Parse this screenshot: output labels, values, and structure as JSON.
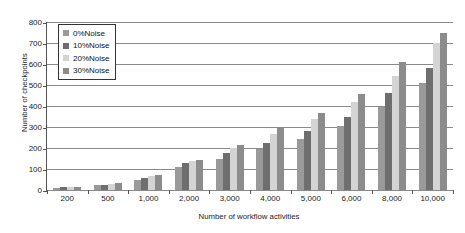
{
  "chart_data": {
    "type": "bar",
    "title": "",
    "xlabel": "Number of workflow activities",
    "ylabel": "Number of checkpoints",
    "ylim": [
      0,
      800
    ],
    "yticks": [
      0,
      100,
      200,
      300,
      400,
      500,
      600,
      700,
      800
    ],
    "ytick_labels": [
      "0",
      "100",
      "200",
      "300",
      "400",
      "500",
      "600",
      "700",
      "800"
    ],
    "grid": true,
    "legend_position": "upper-left",
    "categories": [
      "200",
      "500",
      "1,000",
      "2,000",
      "3,000",
      "4,000",
      "5,000",
      "6,000",
      "8,000",
      "10,000"
    ],
    "series": [
      {
        "name": "0%Noise",
        "color": "#9a9a9a",
        "values": [
          10,
          22,
          48,
          110,
          150,
          195,
          245,
          305,
          395,
          510
        ]
      },
      {
        "name": "10%Noise",
        "color": "#6e6e6e",
        "values": [
          12,
          26,
          58,
          128,
          175,
          225,
          280,
          350,
          460,
          580
        ]
      },
      {
        "name": "20%Noise",
        "color": "#d4d4d4",
        "values": [
          14,
          30,
          68,
          140,
          200,
          265,
          340,
          420,
          545,
          700
        ]
      },
      {
        "name": "30%Noise",
        "color": "#8c8c8c",
        "values": [
          16,
          34,
          72,
          145,
          215,
          295,
          365,
          455,
          610,
          750
        ]
      }
    ]
  },
  "legend": {
    "items": [
      {
        "label": "0%Noise"
      },
      {
        "label": "10%Noise"
      },
      {
        "label": "20%Noise"
      },
      {
        "label": "30%Noise"
      }
    ]
  }
}
